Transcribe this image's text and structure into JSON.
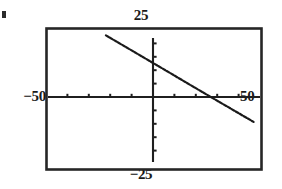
{
  "chart_data": {
    "type": "line",
    "title": "",
    "subtitle": "",
    "xlabel": "",
    "ylabel": "",
    "xlim": [
      -50,
      50
    ],
    "ylim": [
      -25,
      25
    ],
    "grid": false,
    "legend": null,
    "axis_style": "centered-cross-with-ticks",
    "frame": true,
    "tick_labels": {
      "x_left": "−50",
      "x_right": "50",
      "y_top": "25",
      "y_bottom": "−25"
    },
    "x_tick_values": [
      -40,
      -30,
      -20,
      -10,
      10,
      20,
      30,
      40
    ],
    "y_tick_values": [
      -20,
      -15,
      -10,
      -5,
      5,
      10,
      15,
      20
    ],
    "series": [
      {
        "name": "line",
        "style": "dotted-line",
        "slope": -0.47,
        "intercept": 12.7,
        "x": [
          -22,
          -10,
          0,
          10,
          20,
          27,
          35,
          47
        ],
        "y": [
          23.0,
          17.4,
          12.7,
          8.0,
          3.3,
          0.0,
          -3.7,
          -9.3
        ]
      }
    ]
  },
  "labels": {
    "top": "25",
    "bottom": "−25",
    "left": "−50",
    "right": "50"
  },
  "colors": {
    "ink": "#1a1a1a",
    "frame": "#262626",
    "axis": "#1f1f1f",
    "curve": "#1a1a1a",
    "background": "#ffffff"
  }
}
